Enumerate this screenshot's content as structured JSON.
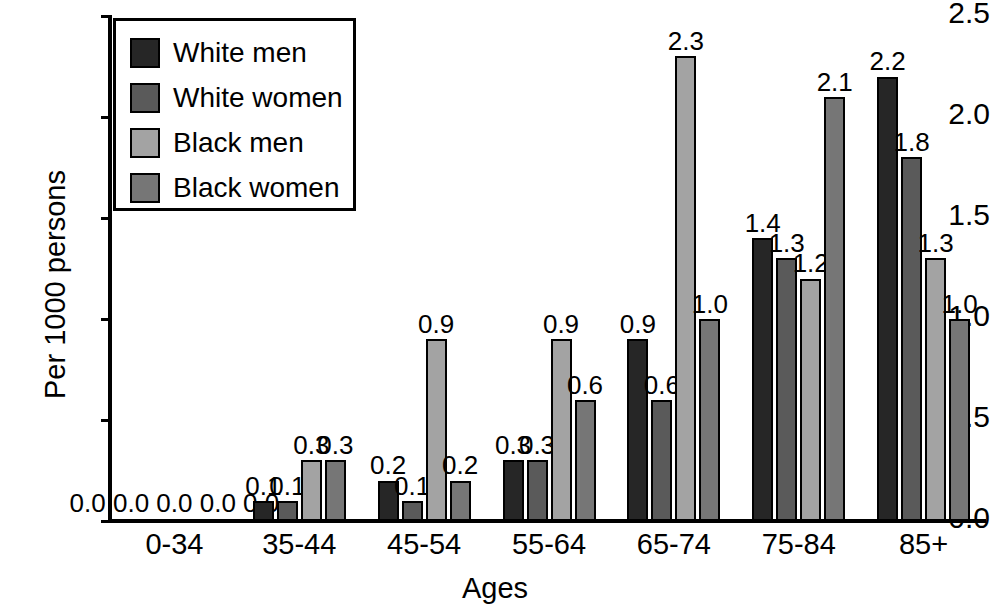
{
  "chart_data": {
    "type": "bar",
    "title": "",
    "xlabel": "Ages",
    "ylabel": "Per 1000 persons",
    "ylim": [
      0.0,
      2.5
    ],
    "ytick_labels": [
      "2.5",
      "2.0",
      "1.5",
      "1.0",
      "0.5",
      "0.0"
    ],
    "ytick_values": [
      2.5,
      2.0,
      1.5,
      1.0,
      0.5,
      0.0
    ],
    "grid": false,
    "legend_position": "top-left",
    "categories": [
      "0-34",
      "35-44",
      "45-54",
      "55-64",
      "65-74",
      "75-84",
      "85+"
    ],
    "series": [
      {
        "name": "White men",
        "color": "#262626",
        "values": [
          0.0,
          0.1,
          0.2,
          0.3,
          0.9,
          1.4,
          2.2
        ],
        "labels": [
          "0.0",
          "0.1",
          "0.2",
          "0.3",
          "0.9",
          "1.4",
          "2.2"
        ]
      },
      {
        "name": "White women",
        "color": "#5a5a5a",
        "values": [
          0.0,
          0.1,
          0.1,
          0.3,
          0.6,
          1.3,
          1.8
        ],
        "labels": [
          "0.0",
          "0.1",
          "0.1",
          "0.3",
          "0.6",
          "1.3",
          "1.8"
        ]
      },
      {
        "name": "Black men",
        "color": "#a3a3a3",
        "values": [
          0.0,
          0.3,
          0.9,
          0.9,
          2.3,
          1.2,
          1.3
        ],
        "labels": [
          "0.0",
          "0.3",
          "0.9",
          "0.9",
          "2.3",
          "1.2",
          "1.3"
        ]
      },
      {
        "name": "Black women",
        "color": "#767676",
        "values": [
          0.0,
          0.3,
          0.2,
          0.6,
          1.0,
          2.1,
          1.0
        ],
        "labels": [
          "0.0",
          "0.3",
          "0.2",
          "0.6",
          "1.0",
          "2.1",
          "1.0"
        ]
      }
    ],
    "zero_group_extra_label": "0.0"
  },
  "legend": {
    "entries": [
      {
        "label": "White men",
        "color": "#262626"
      },
      {
        "label": "White women",
        "color": "#5a5a5a"
      },
      {
        "label": "Black men",
        "color": "#a3a3a3"
      },
      {
        "label": "Black women",
        "color": "#767676"
      }
    ]
  }
}
